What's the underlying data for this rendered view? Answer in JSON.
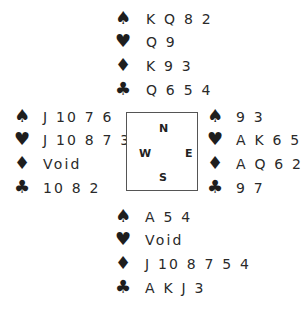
{
  "suits": {
    "spades": "♠",
    "hearts": "♥",
    "diamonds": "♦",
    "clubs": "♣"
  },
  "compass": {
    "north": "N",
    "south": "S",
    "east": "E",
    "west": "W"
  },
  "hands": {
    "north": {
      "spades": "K Q 8 2",
      "hearts": "Q 9",
      "diamonds": "K 9 3",
      "clubs": "Q 6 5 4"
    },
    "west": {
      "spades": "J 10 7 6",
      "hearts": "J 10 8 7 3 2",
      "diamonds": "Void",
      "clubs": "10 8 2"
    },
    "east": {
      "spades": "9 3",
      "hearts": "A K 6 5 4",
      "diamonds": "A Q 6 2",
      "clubs": "9 7"
    },
    "south": {
      "spades": "A 5 4",
      "hearts": "Void",
      "diamonds": "J 10 8 7 5 4",
      "clubs": "A K J 3"
    }
  }
}
